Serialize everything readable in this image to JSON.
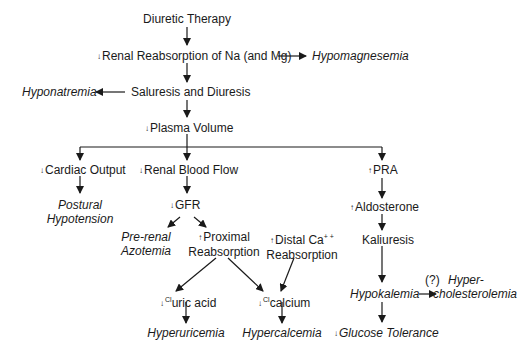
{
  "diagram": {
    "stroke_color": "#1a1a1a",
    "down_mark": "↓",
    "up_mark": "↑",
    "nodes": {
      "diuretic_therapy": "Diuretic Therapy",
      "renal_reabsorption": "Renal Reabsorption of Na (and Mg)",
      "hypomagnesemia": "Hypomagnesemia",
      "saluresis": "Saluresis and Diuresis",
      "hyponatremia": "Hyponatremia",
      "plasma_volume": "Plasma Volume",
      "cardiac_output": "Cardiac Output",
      "postural_1": "Postural",
      "postural_2": "Hypotension",
      "renal_blood_flow": "Renal Blood Flow",
      "gfr": "GFR",
      "prerenal_1": "Pre-renal",
      "prerenal_2": "Azotemia",
      "proximal_1": "Proximal",
      "proximal_2": "Reabsorption",
      "distal_1": "Distal Ca",
      "distal_sup": "+ +",
      "distal_2": "Reabsorption",
      "uric_sup": "Cl",
      "uric": "uric acid",
      "calcium_sup": "Cl",
      "calcium": "calcium",
      "hyperuricemia": "Hyperuricemia",
      "hypercalcemia": "Hypercalcemia",
      "pra": "PRA",
      "aldosterone": "Aldosterone",
      "kaliuresis": "Kaliuresis",
      "hypokalemia": "Hypokalemia",
      "question": "(?)",
      "hyperchol_1": "Hyper-",
      "hyperchol_2": "cholesterolemia",
      "glucose": "Glucose Tolerance"
    }
  }
}
